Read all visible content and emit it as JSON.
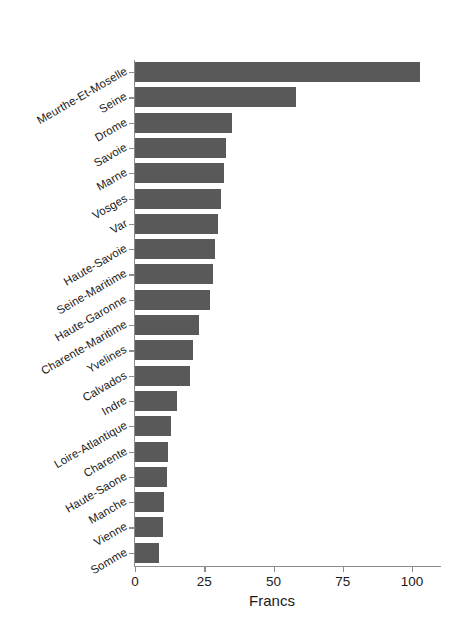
{
  "chart_data": {
    "type": "bar",
    "orientation": "horizontal",
    "title": "",
    "subtitle": "",
    "xlabel": "Francs",
    "ylabel": "",
    "xlim": [
      0,
      103
    ],
    "xticks": [
      0,
      25,
      50,
      75,
      100
    ],
    "xtick_labels": [
      "0",
      "25",
      "50",
      "75",
      "100"
    ],
    "grid": false,
    "legend": false,
    "bar_color": "#595959",
    "axis_color": "#8c8c8c",
    "text_color": "#1a1a1a",
    "background": "#ffffff",
    "categories": [
      "Meurthe-Et-Moselle",
      "Seine",
      "Drome",
      "Savoie",
      "Marne",
      "Vosges",
      "Var",
      "Haute-Savoie",
      "Seine-Maritime",
      "Haute-Garonne",
      "Charente-Maritime",
      "Yvelines",
      "Calvados",
      "Indre",
      "Loire-Atlantique",
      "Charente",
      "Haute-Saone",
      "Manche",
      "Vienne",
      "Somme"
    ],
    "values": [
      103,
      58,
      35,
      33,
      32,
      31,
      30,
      29,
      28,
      27,
      23,
      21,
      20,
      15,
      13,
      12,
      11.5,
      10.5,
      10,
      8.5
    ]
  }
}
